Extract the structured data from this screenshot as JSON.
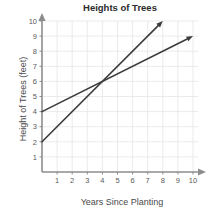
{
  "chart_data": {
    "type": "line",
    "title": "Heights of Trees",
    "xlabel": "Years Since Planting",
    "ylabel": "Height of Trees (feet)",
    "xlim": [
      0,
      10
    ],
    "ylim": [
      0,
      10
    ],
    "xticks": [
      "1",
      "2",
      "3",
      "4",
      "5",
      "6",
      "7",
      "8",
      "9",
      "10"
    ],
    "yticks": [
      "1",
      "2",
      "3",
      "4",
      "5",
      "6",
      "7",
      "8",
      "9",
      "10"
    ],
    "grid": true,
    "legend": "none",
    "series": [
      {
        "name": "Tree A (slower growth)",
        "y_intercept": 4,
        "slope": 0.5,
        "x": [
          0,
          10
        ],
        "values": [
          4,
          9
        ],
        "arrow_end": true
      },
      {
        "name": "Tree B (faster growth)",
        "y_intercept": 2,
        "slope": 1,
        "x": [
          0,
          8
        ],
        "values": [
          2,
          10
        ],
        "arrow_end": true
      }
    ],
    "intersection": [
      4,
      6
    ],
    "colors": {
      "line": "#3b3b3b",
      "grid": "#e2e2e2",
      "axis": "#8c8c8c",
      "title": "#2b2b2b",
      "background": "#ffffff"
    }
  }
}
